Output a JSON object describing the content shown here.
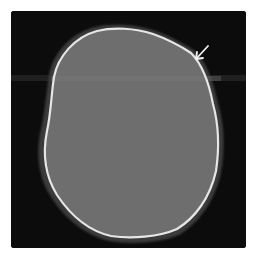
{
  "image": {
    "description": "Axial CT slice of a skull (bone window) showing an irregular cranial outline with an arrow marking a focal point on the upper-right calvarium",
    "colors": {
      "page_background": "#ffffff",
      "scan_background": "#0c0c0c",
      "soft_tissue_halo": "#3a3a3a",
      "brain": "#6e6e6e",
      "bone_rim": "#e6e6e6",
      "arrow": "#f2f2f2",
      "artifact_band": "#262626"
    },
    "annotations": [
      {
        "type": "arrow",
        "icon": "arrow-icon",
        "direction": "down-left",
        "points_to": "upper-right calvarium"
      }
    ]
  }
}
